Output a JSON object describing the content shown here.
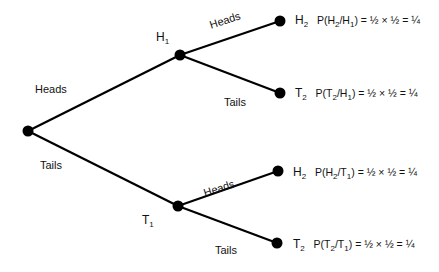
{
  "nodes": {
    "root": {
      "x": 28,
      "y": 131
    },
    "h1": {
      "x": 180,
      "y": 55,
      "label": "H",
      "sub": "1"
    },
    "t1": {
      "x": 178,
      "y": 206,
      "label": "T",
      "sub": "1"
    },
    "h2_top": {
      "x": 280,
      "y": 21,
      "label": "H",
      "sub": "2"
    },
    "t2_top": {
      "x": 280,
      "y": 93,
      "label": "T",
      "sub": "2"
    },
    "h2_bottom": {
      "x": 278,
      "y": 171,
      "label": "H",
      "sub": "2"
    },
    "t2_bottom": {
      "x": 277,
      "y": 243,
      "label": "T",
      "sub": "2"
    }
  },
  "edges": {
    "root_h1": "Heads",
    "root_t1": "Tails",
    "h1_h2": "Heads",
    "h1_t2": "Tails",
    "t1_h2": "Heads",
    "t1_t2": "Tails"
  },
  "probabilities": [
    {
      "a": "H",
      "a_sub": "2",
      "b": "H",
      "b_sub": "1",
      "formula": ") = ½ × ½ = ¼"
    },
    {
      "a": "T",
      "a_sub": "2",
      "b": "H",
      "b_sub": "1",
      "formula": ") = ½ × ½ = ¼"
    },
    {
      "a": "H",
      "a_sub": "2",
      "b": "T",
      "b_sub": "1",
      "formula": ") = ½ × ½ = ¼"
    },
    {
      "a": "T",
      "a_sub": "2",
      "b": "T",
      "b_sub": "1",
      "formula": ") = ½ × ½ = ¼"
    }
  ],
  "prob_prefix": "P(",
  "slash": "/"
}
